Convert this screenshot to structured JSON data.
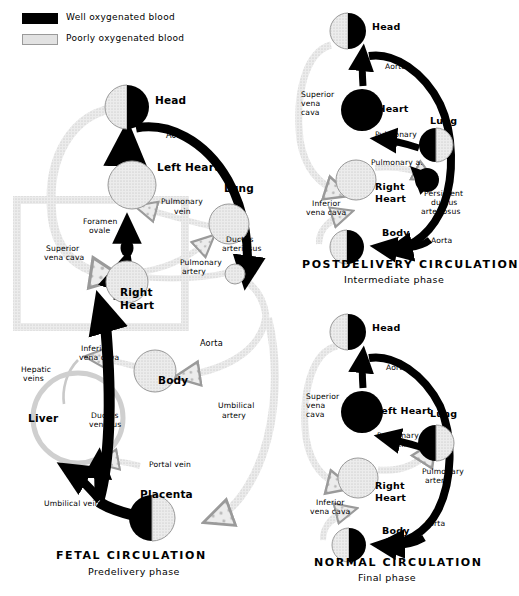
{
  "figure": {
    "colors": {
      "oxygenated": "#000000",
      "deoxygenated": "#dedede",
      "deoxygenated_stroke": "#9a9a9a",
      "background": "#ffffff"
    }
  },
  "legend": {
    "items": [
      {
        "swatch": "dark",
        "label": "Well oxygenated blood"
      },
      {
        "swatch": "light",
        "label": "Poorly oxygenated blood"
      }
    ]
  },
  "panels": [
    {
      "id": "fetal",
      "caption": "FETAL CIRCULATION",
      "subcaption": "Predelivery phase",
      "organs": [
        {
          "name": "Head",
          "fill": "half-right-dark"
        },
        {
          "name": "Left Heart",
          "fill": "light"
        },
        {
          "name": "Lung",
          "fill": "light"
        },
        {
          "name": "Right Heart",
          "fill": "light"
        },
        {
          "name": "Body",
          "fill": "light"
        },
        {
          "name": "Liver",
          "fill": "ring-light"
        },
        {
          "name": "Placenta",
          "fill": "half-left-dark"
        }
      ],
      "vessels": [
        "Aorta",
        "Pulmonary vein",
        "Pulmonary artery",
        "Ductus arteriosus",
        "Foramen ovale",
        "Superior vena cava",
        "Inferior vena cava",
        "Hepatic veins",
        "Ductus venosus",
        "Portal vein",
        "Umbilical vein",
        "Umbilical artery"
      ]
    },
    {
      "id": "postdelivery",
      "caption": "POSTDELIVERY CIRCULATION",
      "subcaption": "Intermediate phase",
      "organs": [
        {
          "name": "Head",
          "fill": "half-right-dark"
        },
        {
          "name": "Left Heart",
          "fill": "dark"
        },
        {
          "name": "Lung",
          "fill": "half-left-dark"
        },
        {
          "name": "Right Heart",
          "fill": "light"
        },
        {
          "name": "Body",
          "fill": "half-right-dark"
        }
      ],
      "vessels": [
        "Aorta",
        "Pulmonary vein",
        "Pulmonary a.",
        "Persistent ductus arteriosus",
        "Superior vena cava",
        "Inferior vena cava"
      ]
    },
    {
      "id": "normal",
      "caption": "NORMAL CIRCULATION",
      "subcaption": "Final phase",
      "organs": [
        {
          "name": "Head",
          "fill": "half-right-dark"
        },
        {
          "name": "Left Heart",
          "fill": "dark"
        },
        {
          "name": "Lung",
          "fill": "half-left-dark"
        },
        {
          "name": "Right Heart",
          "fill": "light"
        },
        {
          "name": "Body",
          "fill": "half-right-dark"
        }
      ],
      "vessels": [
        "Aorta",
        "Pulmonary vein",
        "Pulmonary artery",
        "Superior vena cava",
        "Inferior vena cava"
      ]
    }
  ],
  "labels": {
    "fetal": {
      "head": "Head",
      "left_heart": "Left Heart",
      "lung": "Lung",
      "right_heart_1": "Right",
      "right_heart_2": "Heart",
      "body": "Body",
      "liver": "Liver",
      "placenta": "Placenta",
      "aorta_top": "Aorta",
      "aorta_bottom": "Aorta",
      "pulmonary_vein_1": "Pulmonary",
      "pulmonary_vein_2": "vein",
      "pulmonary_artery_1": "Pulmonary",
      "pulmonary_artery_2": "artery",
      "ductus_arteriosus_1": "Ductus",
      "ductus_arteriosus_2": "arteriosus",
      "foramen_ovale_1": "Foramen",
      "foramen_ovale_2": "ovale",
      "svc_1": "Superior",
      "svc_2": "vena cava",
      "ivc_1": "Inferior",
      "ivc_2": "vena cava",
      "hepatic_1": "Hepatic",
      "hepatic_2": "veins",
      "ductus_venosus_1": "Ductus",
      "ductus_venosus_2": "venosus",
      "portal_vein": "Portal vein",
      "umbilical_vein": "Umbilical vein",
      "umbilical_artery_1": "Umbilical",
      "umbilical_artery_2": "artery",
      "caption": "FETAL  CIRCULATION",
      "subcaption": "Predelivery phase"
    },
    "post": {
      "head": "Head",
      "left_heart": "Left Heart",
      "lung": "Lung",
      "right_heart_1": "Right",
      "right_heart_2": "Heart",
      "body": "Body",
      "aorta_top": "Aorta",
      "aorta_bottom": "Aorta",
      "pulmonary_vein_1": "Pulmonary",
      "pulmonary_vein_2": "vein",
      "pulmonary_a": "Pulmonary a.",
      "pda_1": "Persistent",
      "pda_2": "ductus",
      "pda_3": "arteriosus",
      "svc_1": "Superior",
      "svc_2": "vena",
      "svc_3": "cava",
      "ivc_1": "Inferior",
      "ivc_2": "vena cava",
      "caption": "POSTDELIVERY  CIRCULATION",
      "subcaption": "Intermediate phase"
    },
    "normal": {
      "head": "Head",
      "left_heart": "Left Heart",
      "lung": "Lung",
      "right_heart_1": "Right",
      "right_heart_2": "Heart",
      "body": "Body",
      "aorta_top": "Aorta",
      "aorta_bottom": "Aorta",
      "pulmonary_vein_1": "Pulmonary",
      "pulmonary_vein_2": "vein",
      "pulmonary_artery_1": "Pulmonary",
      "pulmonary_artery_2": "artery",
      "svc_1": "Superior",
      "svc_2": "vena",
      "svc_3": "cava",
      "ivc_1": "Inferior",
      "ivc_2": "vena cava",
      "caption": "NORMAL  CIRCULATION",
      "subcaption": "Final phase"
    }
  }
}
